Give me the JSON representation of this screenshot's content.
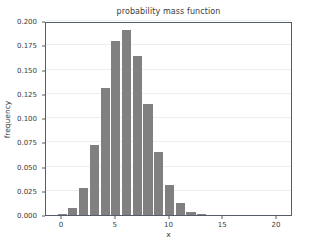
{
  "chart_data": {
    "type": "bar",
    "title": "probability mass function",
    "xlabel": "x",
    "ylabel": "frequency",
    "categories": [
      0,
      1,
      2,
      3,
      4,
      5,
      6,
      7,
      8,
      9,
      10,
      11,
      12,
      13
    ],
    "values": [
      0.001,
      0.007,
      0.028,
      0.072,
      0.131,
      0.179,
      0.191,
      0.164,
      0.114,
      0.065,
      0.031,
      0.012,
      0.003,
      0.001
    ],
    "xlim": [
      -1.5,
      21.5
    ],
    "ylim": [
      0.0,
      0.2
    ],
    "xticks": [
      0,
      5,
      10,
      15,
      20
    ],
    "xtick_labels": [
      "0",
      "5",
      "10",
      "15",
      "20"
    ],
    "yticks": [
      0.0,
      0.025,
      0.05,
      0.075,
      0.1,
      0.125,
      0.15,
      0.175,
      0.2
    ],
    "ytick_labels": [
      "0.000",
      "0.025",
      "0.050",
      "0.075",
      "0.100",
      "0.125",
      "0.150",
      "0.175",
      "0.200"
    ],
    "grid": true,
    "grid_axis": "y",
    "legend": false,
    "bar_color": "#808080",
    "bar_width": 0.85,
    "background_color": "#ffffff",
    "axis_color": "#555c63",
    "grid_color": "#eceef0",
    "text_color": "#3b3b3b"
  }
}
